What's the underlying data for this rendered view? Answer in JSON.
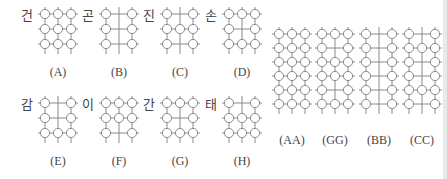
{
  "colors": {
    "line": "#8a8a8a",
    "circle_fill": "#ffffff",
    "text": "#444444"
  },
  "small_panels": [
    {
      "id": "A",
      "label": "(A)",
      "char": "건",
      "pattern": [
        "OOO",
        "OOO",
        "OOO"
      ]
    },
    {
      "id": "B",
      "label": "(B)",
      "char": "곤",
      "pattern": [
        "O+O",
        "O+O",
        "O+O"
      ]
    },
    {
      "id": "C",
      "label": "(C)",
      "char": "진",
      "pattern": [
        "O+O",
        "OOO",
        "O+O"
      ]
    },
    {
      "id": "D",
      "label": "(D)",
      "char": "손",
      "pattern": [
        "OOO",
        "O+O",
        "OOO"
      ]
    },
    {
      "id": "E",
      "label": "(E)",
      "char": "감",
      "pattern": [
        "O+O",
        "O+O",
        "OOO"
      ]
    },
    {
      "id": "F",
      "label": "(F)",
      "char": "이",
      "pattern": [
        "OOO",
        "OOO",
        "O+O"
      ]
    },
    {
      "id": "G",
      "label": "(G)",
      "char": "간",
      "pattern": [
        "OOO",
        "O+O",
        "OOO"
      ]
    },
    {
      "id": "H",
      "label": "(H)",
      "char": "태",
      "pattern": [
        "O+O",
        "OOO",
        "OOO"
      ]
    }
  ],
  "large_panels": [
    {
      "id": "AA",
      "label": "(AA)",
      "pattern": [
        "OOO",
        "OOO",
        "OOO",
        "OOO",
        "OOO",
        "OOO"
      ]
    },
    {
      "id": "GG",
      "label": "(GG)",
      "pattern": [
        "OOO",
        "O+O",
        "OOO",
        "OOO",
        "O+O",
        "OOO"
      ]
    },
    {
      "id": "BB",
      "label": "(BB)",
      "pattern": [
        "O+O",
        "O+O",
        "O+O",
        "O+O",
        "O+O",
        "O+O"
      ]
    },
    {
      "id": "CC",
      "label": "(CC)",
      "pattern": [
        "O+O",
        "OOO",
        "O+O",
        "O+O",
        "OOO",
        "O+O"
      ]
    }
  ]
}
